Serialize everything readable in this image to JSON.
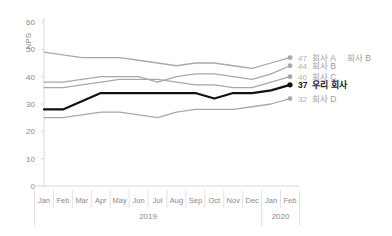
{
  "chart_data": {
    "type": "line",
    "title": "",
    "xlabel": "",
    "ylabel": "NPS",
    "ylim": [
      0,
      60
    ],
    "yticks": [
      0,
      10,
      20,
      30,
      40,
      50,
      60
    ],
    "grid": false,
    "legend_position": "right-end-labels",
    "x": [
      "Jan",
      "Feb",
      "Mar",
      "Apr",
      "May",
      "Jun",
      "Jul",
      "Aug",
      "Sep",
      "Oct",
      "Nov",
      "Dec",
      "Jan",
      "Feb"
    ],
    "x_groups": [
      {
        "label": "2019",
        "start": 0,
        "end": 11
      },
      {
        "label": "2020",
        "start": 12,
        "end": 13
      }
    ],
    "series": [
      {
        "name": "회사 A",
        "end_value": 47,
        "color": "#a8a8a8",
        "highlight": false,
        "values": [
          49,
          48,
          47,
          47,
          47,
          46,
          45,
          44,
          45,
          45,
          44,
          43,
          45,
          47
        ]
      },
      {
        "name": "회사 B",
        "end_value": 44,
        "color": "#a8a8a8",
        "highlight": false,
        "values": [
          38,
          38,
          39,
          40,
          40,
          40,
          38,
          40,
          41,
          41,
          40,
          39,
          41,
          44
        ]
      },
      {
        "name": "회사 C",
        "end_value": 40,
        "color": "#a8a8a8",
        "highlight": false,
        "values": [
          36,
          36,
          37,
          38,
          39,
          39,
          39,
          38,
          37,
          37,
          36,
          36,
          38,
          40
        ]
      },
      {
        "name": "우리 회사",
        "end_value": 37,
        "color": "#111111",
        "highlight": true,
        "values": [
          28,
          28,
          31,
          34,
          34,
          34,
          34,
          34,
          34,
          32,
          34,
          34,
          35,
          37
        ]
      },
      {
        "name": "회사 D",
        "end_value": 32,
        "color": "#a8a8a8",
        "highlight": false,
        "values": [
          25,
          25,
          26,
          27,
          27,
          26,
          25,
          27,
          28,
          28,
          28,
          29,
          30,
          32
        ]
      }
    ],
    "extra_labels": [
      {
        "text": "회사 B",
        "near": "회사 A"
      }
    ]
  }
}
